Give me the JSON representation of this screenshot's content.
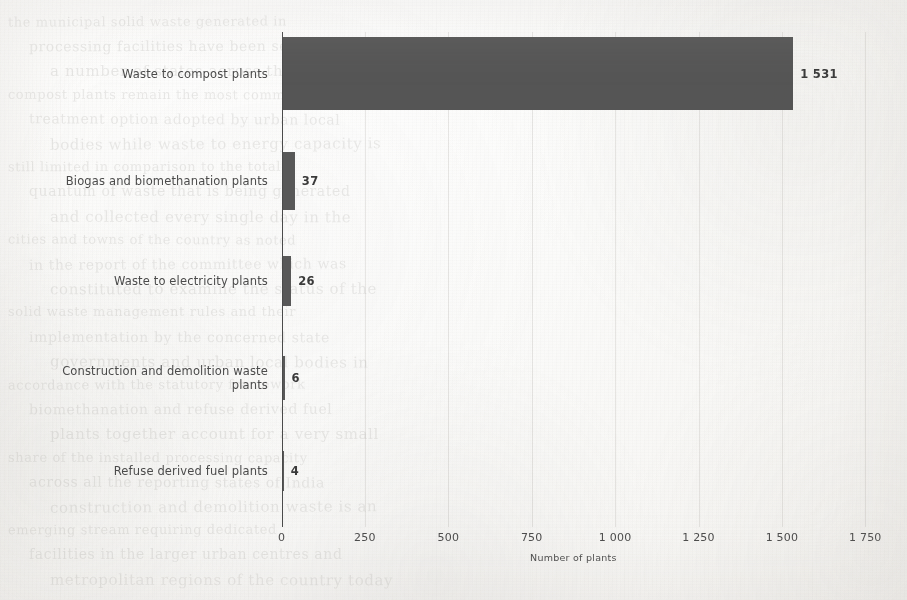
{
  "chart_data": {
    "type": "bar",
    "orientation": "horizontal",
    "title": "",
    "xlabel": "Number of plants",
    "ylabel": "",
    "categories": [
      "Waste to compost plants",
      "Biogas and biomethanation plants",
      "Waste to electricity plants",
      "Construction and demolition waste plants",
      "Refuse derived fuel plants"
    ],
    "values": [
      1531,
      37,
      26,
      6,
      4
    ],
    "value_labels": [
      "1 531",
      "37",
      "26",
      "6",
      "4"
    ],
    "xlim": [
      0,
      1750
    ],
    "xticks": [
      0,
      250,
      500,
      750,
      1000,
      1250,
      1500,
      1750
    ],
    "xtick_labels": [
      "0",
      "250",
      "500",
      "750",
      "1 000",
      "1 250",
      "1 500",
      "1 750"
    ],
    "grid": true,
    "legend": false,
    "bar_color": "#585858",
    "axis_color": "#4a4a4a",
    "text_color": "#4b4b4b"
  },
  "ghost_text": {
    "lines": [
      "the municipal solid waste generated in",
      "processing facilities have been set up in",
      "a number of states across the country for",
      "compost plants remain the most common",
      "treatment option adopted by urban local",
      "bodies while waste to energy capacity is",
      "still limited in comparison to the total",
      "quantum of waste that is being generated",
      "and collected every single day in the",
      "cities and towns of the country as noted",
      "in the report of the committee which was",
      "constituted to examine the status of the",
      "solid waste management rules and their",
      "implementation by the concerned state",
      "governments and urban local bodies in",
      "accordance with the statutory framework",
      "biomethanation and refuse derived fuel",
      "plants together account for a very small",
      "share of the installed processing capacity",
      "across all the reporting states of India",
      "construction and demolition waste is an",
      "emerging stream requiring dedicated",
      "facilities in the larger urban centres and",
      "metropolitan regions of the country today"
    ]
  }
}
